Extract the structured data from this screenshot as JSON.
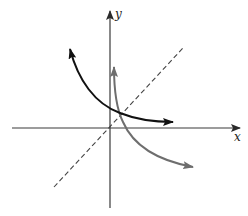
{
  "diagram": {
    "type": "function-and-inverse-reflection",
    "axes": {
      "x_label": "x",
      "y_label": "y",
      "color": "#3a3a3a"
    },
    "reference_line": {
      "description": "y = x",
      "style": "dashed",
      "color": "#444444"
    },
    "curves": [
      {
        "name": "decreasing-exponential",
        "color": "#111111",
        "arrows": "both-ends"
      },
      {
        "name": "inverse-function",
        "color": "#6e6e6e",
        "arrows": "both-ends"
      }
    ]
  }
}
